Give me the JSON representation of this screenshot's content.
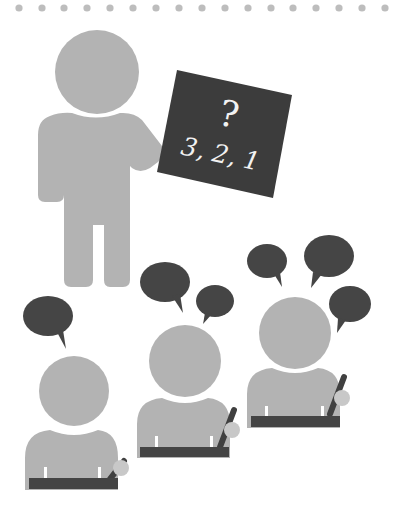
{
  "illustration": {
    "subject": "teacher-with-board-and-students",
    "board": {
      "symbol": "?",
      "sequence": "3, 2, 1"
    },
    "students_count": 3,
    "speech_bubbles": {
      "student_1": 1,
      "student_2": 2,
      "student_3": 3
    }
  },
  "colors": {
    "figure": "#b3b3b3",
    "board": "#3c3c3c",
    "bubble": "#454545",
    "desk": "#444444",
    "dots": "#bdbdbd",
    "background": "#ffffff",
    "board_text": "#f2f2f2"
  }
}
